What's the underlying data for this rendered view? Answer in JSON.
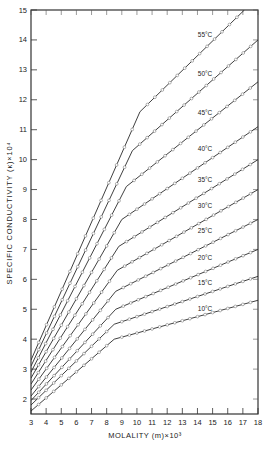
{
  "chart_data": {
    "type": "line",
    "title": "",
    "xlabel": "MOLALITY (m)×10³",
    "ylabel": "SPECIFIC CONDUCTIVITY (κ)×10⁴",
    "xlim": [
      3,
      18
    ],
    "ylim": [
      1.5,
      15
    ],
    "xticks": [
      3,
      4,
      5,
      6,
      7,
      8,
      9,
      10,
      11,
      12,
      13,
      14,
      15,
      16,
      17,
      18
    ],
    "yticks": [
      2,
      3,
      4,
      5,
      6,
      7,
      8,
      9,
      10,
      11,
      12,
      13,
      14,
      15
    ],
    "grid": false,
    "legend": "inline labels on curves",
    "markers": "open circles",
    "series": [
      {
        "name": "55°C",
        "x": [
          3,
          10.2,
          17.1
        ],
        "y": [
          3.3,
          11.6,
          15.0
        ],
        "label_pos": [
          14.5,
          14.1
        ]
      },
      {
        "name": "50°C",
        "x": [
          3,
          9.7,
          18
        ],
        "y": [
          3.1,
          10.3,
          14.0
        ],
        "label_pos": [
          14.5,
          12.8
        ]
      },
      {
        "name": "45°C",
        "x": [
          3,
          9.3,
          18
        ],
        "y": [
          2.9,
          9.1,
          12.6
        ],
        "label_pos": [
          14.5,
          11.5
        ]
      },
      {
        "name": "40°C",
        "x": [
          3,
          9.0,
          18
        ],
        "y": [
          2.7,
          8.0,
          11.1
        ],
        "label_pos": [
          14.5,
          10.3
        ]
      },
      {
        "name": "35°C",
        "x": [
          3,
          8.8,
          18
        ],
        "y": [
          2.5,
          7.1,
          10.0
        ],
        "label_pos": [
          14.5,
          9.25
        ]
      },
      {
        "name": "30°C",
        "x": [
          3,
          8.7,
          18
        ],
        "y": [
          2.3,
          6.3,
          9.0
        ],
        "label_pos": [
          14.5,
          8.4
        ]
      },
      {
        "name": "25°C",
        "x": [
          3,
          8.6,
          18
        ],
        "y": [
          2.1,
          5.6,
          8.0
        ],
        "label_pos": [
          14.5,
          7.55
        ]
      },
      {
        "name": "20°C",
        "x": [
          3,
          8.6,
          18
        ],
        "y": [
          1.95,
          5.0,
          7.0
        ],
        "label_pos": [
          14.5,
          6.65
        ]
      },
      {
        "name": "15°C",
        "x": [
          3,
          8.5,
          18
        ],
        "y": [
          1.8,
          4.5,
          6.1
        ],
        "label_pos": [
          14.5,
          5.8
        ]
      },
      {
        "name": "10°C",
        "x": [
          3,
          8.5,
          18
        ],
        "y": [
          1.6,
          4.0,
          5.3
        ],
        "label_pos": [
          14.5,
          4.95
        ]
      }
    ]
  }
}
